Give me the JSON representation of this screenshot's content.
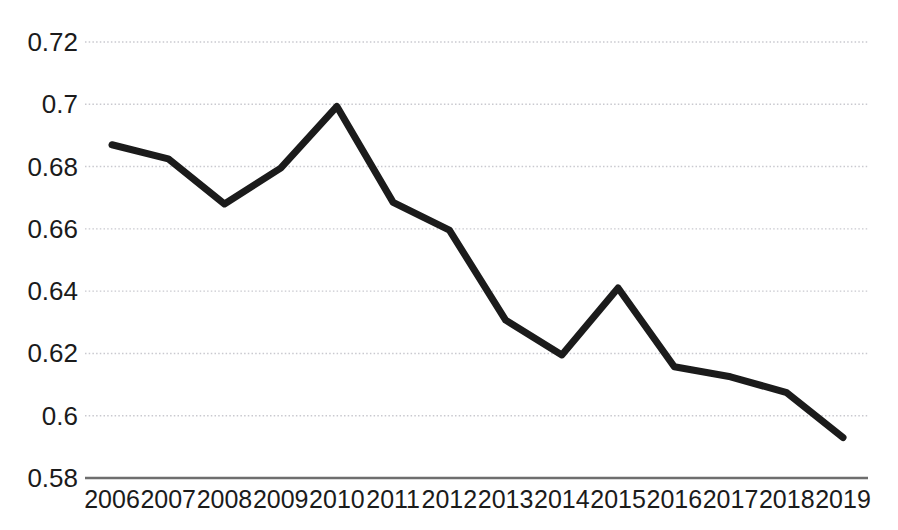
{
  "chart_data": {
    "type": "line",
    "title": "",
    "subtitle": "",
    "xlabel": "",
    "ylabel": "",
    "categories": [
      "2006",
      "2007",
      "2008",
      "2009",
      "2010",
      "2011",
      "2012",
      "2013",
      "2014",
      "2015",
      "2016",
      "2017",
      "2018",
      "2019"
    ],
    "x": [
      2006,
      2007,
      2008,
      2009,
      2010,
      2011,
      2012,
      2013,
      2014,
      2015,
      2016,
      2017,
      2018,
      2019
    ],
    "values": [
      0.687,
      0.6825,
      0.668,
      0.6795,
      0.6993,
      0.6685,
      0.6596,
      0.6307,
      0.6195,
      0.641,
      0.6157,
      0.6125,
      0.6074,
      0.593
    ],
    "series": [
      {
        "name": "series-1",
        "values": [
          0.687,
          0.6825,
          0.668,
          0.6795,
          0.6993,
          0.6685,
          0.6596,
          0.6307,
          0.6195,
          0.641,
          0.6157,
          0.6125,
          0.6074,
          0.593
        ]
      }
    ],
    "ylim": [
      0.58,
      0.72
    ],
    "xlim": [
      2006,
      2019
    ],
    "yticks": [
      0.58,
      0.6,
      0.62,
      0.64,
      0.66,
      0.68,
      0.7,
      0.72
    ],
    "ytick_labels": [
      "0.58",
      "0.6",
      "0.62",
      "0.64",
      "0.66",
      "0.68",
      "0.7",
      "0.72"
    ],
    "grid": true,
    "grid_style": "dotted-horizontal",
    "legend": false,
    "legend_position": "none",
    "line_color": "#1b1b1b",
    "line_width": 7,
    "grid_color": "#c9c9cf",
    "axis_color": "#6e6e6e",
    "background_color": "#ffffff",
    "markers": false
  }
}
